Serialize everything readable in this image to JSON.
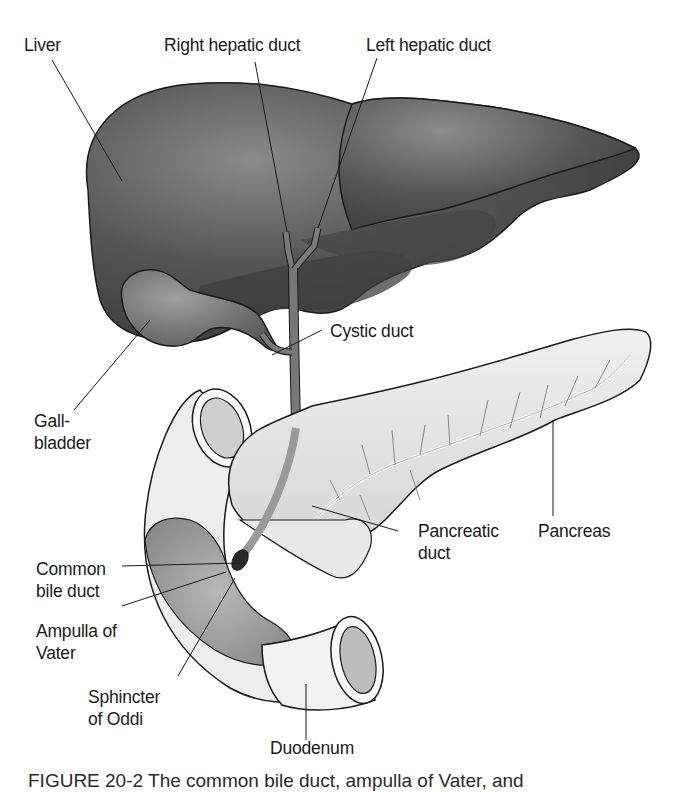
{
  "figure": {
    "caption_partial": "FIGURE 20-2 The common bile duct, ampulla of Vater, and"
  },
  "labels": {
    "liver": "Liver",
    "right_hepatic_duct": "Right hepatic duct",
    "left_hepatic_duct": "Left hepatic duct",
    "cystic_duct": "Cystic duct",
    "gallbladder": "Gall-\nbladder",
    "pancreas": "Pancreas",
    "pancreatic_duct": "Pancreatic\nduct",
    "common_bile_duct": "Common\nbile duct",
    "ampulla_of_vater": "Ampulla of\nVater",
    "sphincter_of_oddi": "Sphincter\nof Oddi",
    "duodenum": "Duodenum"
  },
  "colors": {
    "liver": "#4a4a4a",
    "liver_highlight": "#7a7a7a",
    "gallbladder": "#6e6e6e",
    "duct": "#777777",
    "pancreas": "#e4e4e4",
    "duodenum": "#ececec",
    "duodenum_inner": "#a8a8a8",
    "outline": "#1a1a1a"
  }
}
